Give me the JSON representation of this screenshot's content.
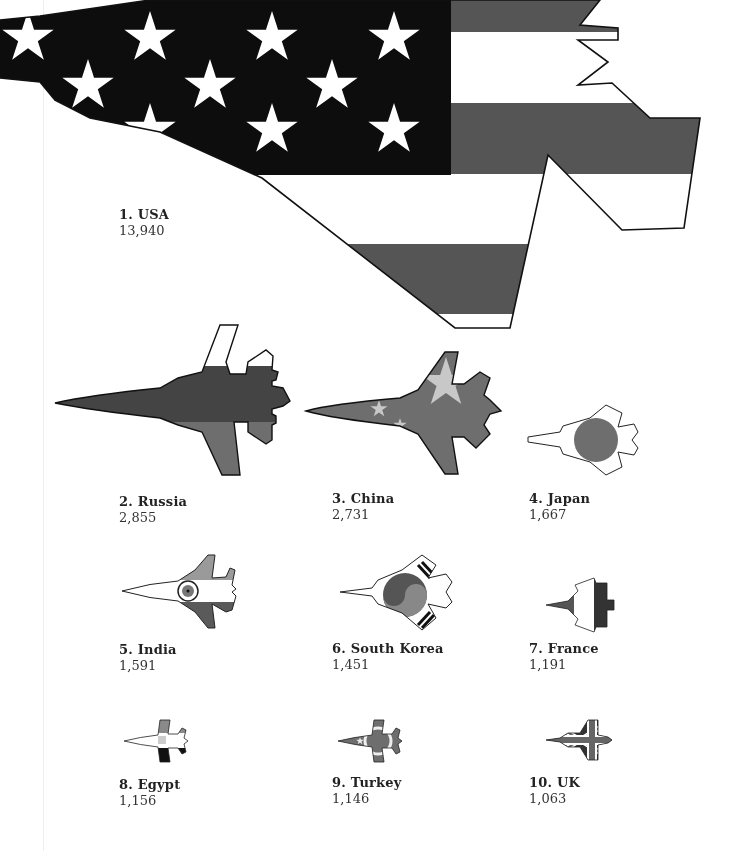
{
  "colors": {
    "navy": "#0d0d0d",
    "red": "#555555",
    "white": "#ffffff",
    "mid_gray": "#7a7a7a",
    "light_gray": "#b0b0b0",
    "outline": "#111111"
  },
  "countries": [
    {
      "rank_label": "1. USA",
      "value": "13,940",
      "flag_icon": "usa-flag-jet-icon"
    },
    {
      "rank_label": "2. Russia",
      "value": "2,855",
      "flag_icon": "russia-flag-jet-icon"
    },
    {
      "rank_label": "3. China",
      "value": "2,731",
      "flag_icon": "china-flag-jet-icon"
    },
    {
      "rank_label": "4. Japan",
      "value": "1,667",
      "flag_icon": "japan-flag-jet-icon"
    },
    {
      "rank_label": "5. India",
      "value": "1,591",
      "flag_icon": "india-flag-jet-icon"
    },
    {
      "rank_label": "6. South Korea",
      "value": "1,451",
      "flag_icon": "south-korea-flag-jet-icon"
    },
    {
      "rank_label": "7. France",
      "value": "1,191",
      "flag_icon": "france-flag-jet-icon"
    },
    {
      "rank_label": "8. Egypt",
      "value": "1,156",
      "flag_icon": "egypt-flag-jet-icon"
    },
    {
      "rank_label": "9. Turkey",
      "value": "1,146",
      "flag_icon": "turkey-flag-jet-icon"
    },
    {
      "rank_label": "10. UK",
      "value": "1,063",
      "flag_icon": "uk-flag-jet-icon"
    }
  ]
}
